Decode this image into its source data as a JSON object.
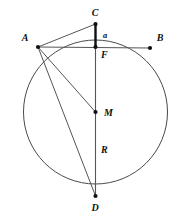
{
  "figure": {
    "background_color": "#ffffff",
    "stroke_color": "#555555",
    "accent_color": "#111111"
  },
  "circle": {
    "name": "main-circle",
    "cx": 95.5,
    "cy": 112,
    "r": 72
  },
  "points": [
    {
      "id": "A",
      "label": "A",
      "x": 38,
      "y": 47,
      "label_x": 25,
      "label_y": 41
    },
    {
      "id": "B",
      "label": "B",
      "x": 150,
      "y": 48,
      "label_x": 160,
      "label_y": 41
    },
    {
      "id": "C",
      "label": "C",
      "x": 95.5,
      "y": 24,
      "label_x": 95,
      "label_y": 16
    },
    {
      "id": "F",
      "label": "F",
      "x": 95.5,
      "y": 47,
      "label_x": 101,
      "label_y": 58
    },
    {
      "id": "M",
      "label": "M",
      "x": 95.5,
      "y": 112,
      "label_x": 104,
      "label_y": 116
    },
    {
      "id": "D",
      "label": "D",
      "x": 95.5,
      "y": 196,
      "label_x": 95,
      "label_y": 211
    }
  ],
  "segment_labels": [
    {
      "id": "a",
      "label": "a",
      "x": 103,
      "y": 38,
      "describes": "C-F"
    },
    {
      "id": "R",
      "label": "R",
      "x": 101,
      "y": 153,
      "describes": "M-D"
    }
  ],
  "segments": [
    {
      "id": "CD",
      "name": "vertical-diameter",
      "from": "C",
      "to": "D",
      "style": "thin"
    },
    {
      "id": "AB",
      "name": "chord-ab",
      "from": "A",
      "to": "B",
      "style": "thin"
    },
    {
      "id": "AC",
      "name": "chord-ac",
      "from": "A",
      "to": "C",
      "style": "thin"
    },
    {
      "id": "AM",
      "name": "segment-am",
      "from": "A",
      "to": "M",
      "style": "thin"
    },
    {
      "id": "AD",
      "name": "chord-ad",
      "from": "A",
      "to": "D",
      "style": "thin"
    },
    {
      "id": "CF",
      "name": "segment-cf",
      "from": "C",
      "to": "F",
      "style": "bold"
    }
  ]
}
